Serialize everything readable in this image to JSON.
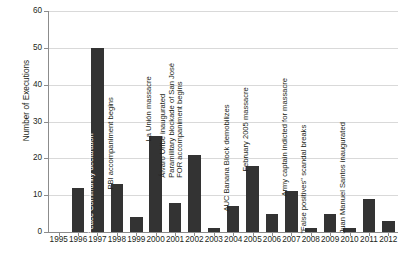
{
  "chart_data": {
    "type": "bar",
    "title": "",
    "xlabel": "",
    "ylabel": "Number of Executions",
    "ylim": [
      0,
      60
    ],
    "yticks": [
      0,
      10,
      20,
      30,
      40,
      50,
      60
    ],
    "grid": true,
    "legend": "none",
    "categories": [
      "1995",
      "1996",
      "1997",
      "1998",
      "1999",
      "2000",
      "2001",
      "2002",
      "2003",
      "2004",
      "2005",
      "2006",
      "2007",
      "2008",
      "2009",
      "2010",
      "2011",
      "2012"
    ],
    "values": [
      0,
      12,
      50,
      13,
      4,
      26,
      8,
      21,
      1,
      7,
      18,
      5,
      11,
      1,
      5,
      1,
      9,
      3
    ],
    "bar_color": "#333333",
    "annotations": [
      {
        "category": "1997",
        "text": "Peace Community declaration",
        "lines": [
          "Peace Community declaration"
        ],
        "placement": "inside-bar"
      },
      {
        "category": "1998",
        "text": "PBI accompaniment begins",
        "lines": [
          "PBI accompaniment begins"
        ],
        "placement": "above-bar"
      },
      {
        "category": "2000",
        "text": "La Unión massacre",
        "lines": [
          "La Unión massacre"
        ],
        "placement": "above-bar"
      },
      {
        "category": "2002",
        "text": "Álvaro Uribe inaugurated; Paramilitary blockade of San José; FOR accompaniment begins",
        "lines": [
          "Álvaro Uribe inaugurated",
          "Paramilitary blockade of San José",
          "FOR accompaniment begins"
        ],
        "placement": "above-bar"
      },
      {
        "category": "2004",
        "text": "AUC Banana Block demobilizes",
        "lines": [
          "AUC Banana Block demobilizes"
        ],
        "placement": "above-bar"
      },
      {
        "category": "2005",
        "text": "February 2005 massacre",
        "lines": [
          "February 2005 massacre"
        ],
        "placement": "above-bar"
      },
      {
        "category": "2007",
        "text": "Army captain indicted for massacre",
        "lines": [
          "Army captain indicted for massacre"
        ],
        "placement": "above-bar"
      },
      {
        "category": "2008",
        "text": "\"False positives\" scandal breaks",
        "lines": [
          "\"False positives\" scandal breaks"
        ],
        "placement": "above-bar"
      },
      {
        "category": "2010",
        "text": "Juan Manuel Santos inaugurated",
        "lines": [
          "Juan Manuel Santos inaugurated"
        ],
        "placement": "above-bar"
      }
    ]
  }
}
